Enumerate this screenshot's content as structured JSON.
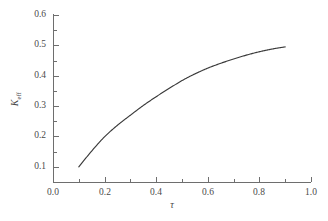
{
  "chart_data": {
    "type": "line",
    "title": "",
    "xlabel": "τ",
    "ylabel_text": "K",
    "ylabel_sub": "eff",
    "xlim": [
      0.0,
      1.0
    ],
    "ylim": [
      0.05,
      0.6
    ],
    "grid": false,
    "legend": null,
    "x_ticks": [
      "0.0",
      "0.2",
      "0.4",
      "0.6",
      "0.8",
      "1.0"
    ],
    "x_tick_values": [
      0.0,
      0.2,
      0.4,
      0.6,
      0.8,
      1.0
    ],
    "x_minor_tick_values": [
      0.1,
      0.3,
      0.5,
      0.7,
      0.9
    ],
    "y_ticks": [
      "0.1",
      "0.2",
      "0.3",
      "0.4",
      "0.5",
      "0.6"
    ],
    "y_tick_values": [
      0.1,
      0.2,
      0.3,
      0.4,
      0.5,
      0.6
    ],
    "y_minor_tick_values": [
      0.15,
      0.25,
      0.35,
      0.45,
      0.55
    ],
    "series": [
      {
        "name": "K_eff",
        "color": "#3a3a3a",
        "x": [
          0.1,
          0.15,
          0.2,
          0.25,
          0.3,
          0.35,
          0.4,
          0.45,
          0.5,
          0.55,
          0.6,
          0.65,
          0.7,
          0.75,
          0.8,
          0.85,
          0.9
        ],
        "y": [
          0.1,
          0.152,
          0.199,
          0.237,
          0.27,
          0.302,
          0.331,
          0.358,
          0.384,
          0.406,
          0.425,
          0.441,
          0.455,
          0.468,
          0.479,
          0.488,
          0.495
        ]
      }
    ]
  },
  "axes": {
    "frame_color": "#6e6e6e",
    "tick_label_color": "#4a4a4a"
  }
}
